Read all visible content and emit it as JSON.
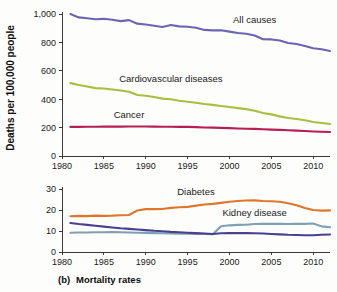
{
  "figure": {
    "caption_prefix": "(b)",
    "caption": "Mortality rates",
    "background_color": "#fdfdfb"
  },
  "chart_data": [
    {
      "type": "line",
      "id": "top-panel",
      "title": "",
      "xlabel": "",
      "ylabel": "Deaths per 100,000 people",
      "xlim": [
        1980,
        2012
      ],
      "ylim": [
        0,
        1000
      ],
      "xticks": [
        1980,
        1985,
        1990,
        1995,
        2000,
        2005,
        2010
      ],
      "xtick_labels": [
        "1980",
        "1985",
        "1990",
        "1995",
        "2000",
        "2005",
        "2010"
      ],
      "yticks": [
        0,
        200,
        400,
        600,
        800,
        1000
      ],
      "ytick_labels": [
        "0",
        "200",
        "400",
        "600",
        "800",
        "1,000"
      ],
      "grid": false,
      "legend_position": "inline-annotations",
      "x": [
        1981,
        1982,
        1983,
        1984,
        1985,
        1986,
        1987,
        1988,
        1989,
        1990,
        1991,
        1992,
        1993,
        1994,
        1995,
        1996,
        1997,
        1998,
        1999,
        2000,
        2001,
        2002,
        2003,
        2004,
        2005,
        2006,
        2007,
        2008,
        2009,
        2010,
        2011,
        2012
      ],
      "series": [
        {
          "name": "All causes",
          "color": "#6b64b4",
          "label_x": 2003,
          "label_y": 935,
          "values": [
            1000,
            976,
            970,
            963,
            966,
            959,
            950,
            957,
            932,
            926,
            917,
            908,
            922,
            913,
            910,
            903,
            888,
            885,
            886,
            876,
            866,
            861,
            848,
            822,
            821,
            813,
            796,
            789,
            775,
            759,
            752,
            740
          ]
        },
        {
          "name": "Cardiovascular diseases",
          "color": "#a8bf3f",
          "label_x": 1993,
          "label_y": 520,
          "values": [
            513,
            500,
            489,
            478,
            475,
            468,
            461,
            452,
            430,
            424,
            415,
            404,
            400,
            389,
            382,
            375,
            366,
            360,
            352,
            345,
            337,
            330,
            318,
            303,
            293,
            279,
            268,
            261,
            252,
            240,
            232,
            225
          ]
        },
        {
          "name": "Cancer",
          "color": "#b51f55",
          "label_x": 1988,
          "label_y": 265,
          "values": [
            205,
            205,
            206,
            206,
            207,
            207,
            207,
            208,
            208,
            208,
            207,
            206,
            206,
            205,
            205,
            203,
            201,
            200,
            198,
            196,
            194,
            192,
            191,
            188,
            186,
            184,
            181,
            179,
            176,
            173,
            171,
            169
          ]
        }
      ]
    },
    {
      "type": "line",
      "id": "bottom-panel",
      "title": "",
      "xlabel": "",
      "ylabel": "",
      "xlim": [
        1980,
        2012
      ],
      "ylim": [
        0,
        30
      ],
      "xticks": [
        1980,
        1985,
        1990,
        1995,
        2000,
        2005,
        2010
      ],
      "xtick_labels": [
        "1980",
        "1985",
        "1990",
        "1995",
        "2000",
        "2005",
        "2010"
      ],
      "yticks": [
        0,
        10,
        20,
        30
      ],
      "ytick_labels": [
        "0",
        "10",
        "20",
        "30"
      ],
      "grid": false,
      "legend_position": "inline-annotations",
      "x": [
        1981,
        1982,
        1983,
        1984,
        1985,
        1986,
        1987,
        1988,
        1989,
        1990,
        1991,
        1992,
        1993,
        1994,
        1995,
        1996,
        1997,
        1998,
        1999,
        2000,
        2001,
        2002,
        2003,
        2004,
        2005,
        2006,
        2007,
        2008,
        2009,
        2010,
        2011,
        2012
      ],
      "series": [
        {
          "name": "Diabetes",
          "color": "#e0762a",
          "label_x": 1996,
          "label_y": 27.3,
          "values": [
            17.0,
            17.2,
            17.1,
            17.3,
            17.2,
            17.3,
            17.5,
            17.6,
            19.8,
            20.4,
            20.4,
            20.5,
            21.0,
            21.3,
            21.5,
            22.1,
            22.6,
            22.9,
            23.4,
            23.9,
            24.3,
            24.5,
            24.6,
            24.3,
            24.2,
            23.9,
            23.2,
            22.3,
            21.0,
            20.0,
            19.7,
            19.8
          ]
        },
        {
          "name": "Kidney disease",
          "color": "#7da0b4",
          "label_x": 2003,
          "label_y": 17.1,
          "values": [
            9.2,
            9.3,
            9.3,
            9.4,
            9.4,
            9.5,
            9.4,
            9.3,
            9.2,
            9.1,
            9.0,
            8.9,
            8.8,
            8.7,
            8.7,
            8.6,
            8.6,
            8.5,
            12.3,
            12.7,
            12.9,
            13.0,
            13.3,
            13.4,
            13.4,
            13.4,
            13.3,
            13.4,
            13.4,
            13.6,
            12.2,
            11.8
          ]
        },
        {
          "name": "",
          "color": "#4a3f91",
          "label_x": null,
          "label_y": null,
          "values": [
            13.8,
            13.3,
            12.9,
            12.5,
            12.1,
            11.7,
            11.3,
            11.0,
            10.7,
            10.4,
            10.1,
            9.9,
            9.6,
            9.4,
            9.2,
            9.0,
            8.8,
            8.6,
            8.9,
            9.0,
            9.0,
            9.0,
            8.9,
            8.8,
            8.6,
            8.4,
            8.2,
            8.1,
            8.0,
            8.0,
            8.2,
            8.3
          ]
        }
      ]
    }
  ]
}
